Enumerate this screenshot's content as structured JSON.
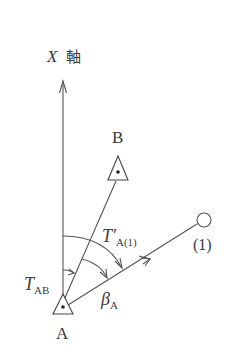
{
  "diagram": {
    "axis_label_var": "X",
    "axis_label_kanji": "軸",
    "points": {
      "B": "B",
      "A": "A",
      "P1": "(1)"
    },
    "angles": {
      "t_ab_main": "T",
      "t_ab_sub": "AB",
      "t_a1_main": "T′",
      "t_a1_sub": "A(1)",
      "beta_main": "β",
      "beta_sub": "A"
    },
    "colors": {
      "line": "#555555",
      "text": "#3a3a3a",
      "background": "#ffffff"
    }
  }
}
